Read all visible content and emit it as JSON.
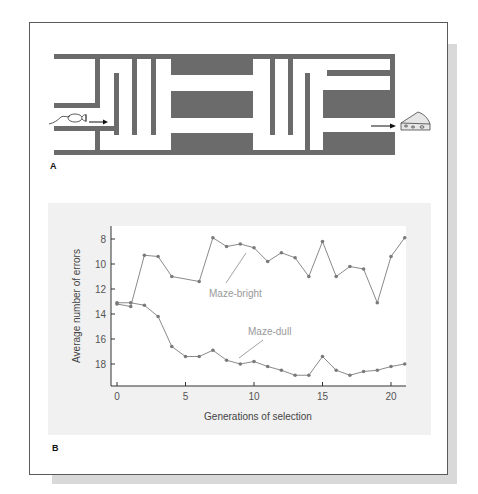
{
  "figure": {
    "panel_a_label": "A",
    "panel_b_label": "B",
    "maze": {
      "wall_color": "#6b6b6b",
      "start_icon": "rat-icon",
      "goal_icon": "cheese-icon"
    }
  },
  "chart_data": {
    "type": "line",
    "title": "",
    "xlabel": "Generations of selection",
    "ylabel": "Average number of  errors",
    "x": [
      0,
      1,
      2,
      3,
      4,
      5,
      6,
      7,
      8,
      9,
      10,
      11,
      12,
      13,
      14,
      15,
      16,
      17,
      18,
      19,
      20,
      21
    ],
    "xlim": [
      0,
      21
    ],
    "ylim": [
      19.8,
      7.2
    ],
    "y_inverted": true,
    "xticks": [
      "0",
      "5",
      "10",
      "15",
      "20"
    ],
    "yticks": [
      "8",
      "10",
      "12",
      "14",
      "16",
      "18"
    ],
    "grid": false,
    "legend": "inline labels",
    "series": [
      {
        "name": "Maze-bright",
        "x": [
          0,
          1,
          2,
          3,
          4,
          6,
          7,
          8,
          9,
          10,
          11,
          12,
          13,
          14,
          15,
          16,
          17,
          18,
          19,
          20,
          21
        ],
        "values": [
          13.2,
          13.4,
          9.3,
          9.4,
          11.0,
          11.4,
          7.9,
          8.6,
          8.4,
          8.7,
          9.8,
          9.1,
          9.5,
          11.0,
          8.2,
          11.0,
          10.2,
          10.4,
          13.1,
          9.4,
          7.9
        ]
      },
      {
        "name": "Maze-dull",
        "x": [
          0,
          1,
          2,
          3,
          4,
          5,
          6,
          7,
          8,
          9,
          10,
          11,
          12,
          13,
          14,
          15,
          16,
          17,
          18,
          19,
          20,
          21
        ],
        "values": [
          13.1,
          13.1,
          13.3,
          14.2,
          16.6,
          17.4,
          17.4,
          16.9,
          17.7,
          18.0,
          17.8,
          18.2,
          18.5,
          18.9,
          18.9,
          17.4,
          18.5,
          18.9,
          18.6,
          18.5,
          18.2,
          18.0
        ]
      }
    ],
    "colors": {
      "line": "#8a8a8a",
      "marker": "#7a7a7a",
      "label": "#9a9a9a",
      "axis": "#333333"
    }
  }
}
